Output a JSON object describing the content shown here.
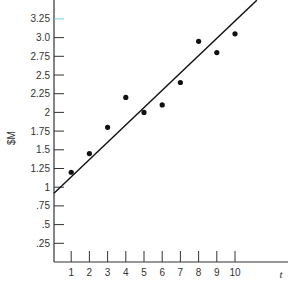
{
  "chart_data": {
    "type": "scatter",
    "title": "",
    "xlabel": "t",
    "ylabel": "$M",
    "x": [
      1,
      2,
      3,
      4,
      5,
      6,
      7,
      8,
      9,
      10
    ],
    "series": [
      {
        "name": "observed",
        "kind": "scatter",
        "values": [
          1.2,
          1.45,
          1.8,
          2.2,
          2.0,
          2.1,
          2.4,
          2.95,
          2.8,
          3.05
        ]
      },
      {
        "name": "trend line",
        "kind": "line",
        "points": [
          [
            0,
            0.92
          ],
          [
            11.2,
            3.5
          ]
        ]
      }
    ],
    "x_ticks": [
      "1",
      "2",
      "3",
      "4",
      "5",
      "6",
      "7",
      "8",
      "9",
      "10"
    ],
    "y_ticks": [
      {
        "value": 0.25,
        "label": ".25"
      },
      {
        "value": 0.5,
        "label": ".5"
      },
      {
        "value": 0.75,
        "label": ".75"
      },
      {
        "value": 1.0,
        "label": "1"
      },
      {
        "value": 1.25,
        "label": "1.25"
      },
      {
        "value": 1.5,
        "label": "1.5"
      },
      {
        "value": 1.75,
        "label": "1.75"
      },
      {
        "value": 2.0,
        "label": "2"
      },
      {
        "value": 2.25,
        "label": "2.25"
      },
      {
        "value": 2.5,
        "label": "2.5"
      },
      {
        "value": 2.75,
        "label": "2.75"
      },
      {
        "value": 3.0,
        "label": "3.0"
      },
      {
        "value": 3.25,
        "label": "3.25",
        "highlighted": true
      }
    ],
    "xlim": [
      0,
      12.8
    ],
    "ylim": [
      0,
      3.5
    ],
    "grid": false,
    "legend": "none",
    "colors": {
      "axis": "#333333",
      "points": "#111111",
      "line": "#111111",
      "highlight_tick": "#6fd3d8",
      "highlight_label": "#6a5fc9"
    }
  }
}
